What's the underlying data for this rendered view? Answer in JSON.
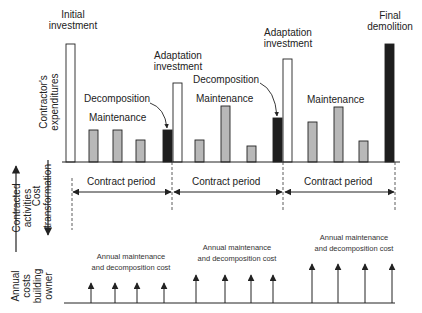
{
  "labels": {
    "initial_investment": [
      "Initial",
      "investment"
    ],
    "adaptation_investment_1": [
      "Adaptation",
      "investment"
    ],
    "adaptation_investment_2": [
      "Adaptation",
      "investment"
    ],
    "final_demolition": [
      "Final",
      "demolition"
    ],
    "decomposition_1": "Decomposition",
    "decomposition_2": "Decomposition",
    "maintenance_1": "Maintenance",
    "maintenance_2": "Maintenance",
    "maintenance_3": "Maintenance",
    "contract_period": [
      "Contract period",
      "Contract period",
      "Contract period"
    ],
    "annual_cost": [
      [
        "Annual maintenance",
        "and decomposition cost"
      ],
      [
        "Annual maintenance",
        "and decomposition cost"
      ],
      [
        "Annual maintenance",
        "and decomposition cost"
      ]
    ]
  },
  "axes": {
    "contractor_expenditures": [
      "Contractor's",
      "expenditures"
    ],
    "contracted_activities": [
      "Contracted",
      "activities"
    ],
    "cost_transformation": [
      "Cost",
      "transformation"
    ],
    "annual_costs_owner": [
      "Annual",
      "costs",
      "building",
      "owner"
    ]
  },
  "colors": {
    "line": "#222222",
    "investment_fill": "#ffffff",
    "maintenance_fill": "#b8b8b8",
    "decomposition_fill": "#1e1e1e"
  },
  "bars": [
    {
      "type": "investment",
      "x": 66,
      "top": 44
    },
    {
      "type": "maintenance",
      "x": 89,
      "top": 130
    },
    {
      "type": "maintenance",
      "x": 113,
      "top": 130
    },
    {
      "type": "maintenance",
      "x": 136,
      "top": 140
    },
    {
      "type": "decomposition",
      "x": 163,
      "top": 130
    },
    {
      "type": "investment",
      "x": 173,
      "top": 83
    },
    {
      "type": "maintenance",
      "x": 195,
      "top": 140
    },
    {
      "type": "maintenance",
      "x": 221,
      "top": 106
    },
    {
      "type": "maintenance",
      "x": 247,
      "top": 146
    },
    {
      "type": "decomposition",
      "x": 273,
      "top": 118
    },
    {
      "type": "investment",
      "x": 283,
      "top": 59
    },
    {
      "type": "maintenance",
      "x": 308,
      "top": 122
    },
    {
      "type": "maintenance",
      "x": 334,
      "top": 107
    },
    {
      "type": "maintenance",
      "x": 359,
      "top": 141
    },
    {
      "type": "decomposition",
      "x": 385,
      "top": 44
    }
  ],
  "owner_arrows": [
    {
      "x": 91,
      "top": 283
    },
    {
      "x": 115,
      "top": 283
    },
    {
      "x": 137,
      "top": 283
    },
    {
      "x": 164,
      "top": 283
    },
    {
      "x": 196,
      "top": 275
    },
    {
      "x": 225,
      "top": 275
    },
    {
      "x": 251,
      "top": 275
    },
    {
      "x": 273,
      "top": 275
    },
    {
      "x": 312,
      "top": 264
    },
    {
      "x": 338,
      "top": 264
    },
    {
      "x": 365,
      "top": 264
    },
    {
      "x": 392,
      "top": 264
    }
  ]
}
